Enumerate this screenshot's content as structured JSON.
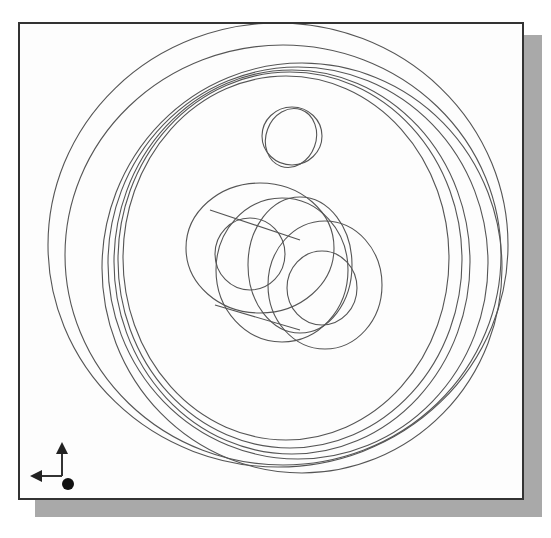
{
  "viewport": {
    "background": "#fdfdfd",
    "border_color": "#333333",
    "shadow_color": "#a9a9a9",
    "line_color": "#555555"
  },
  "model": {
    "description": "Isometric wireframe of a circular wheel/disc with a small hole and an offset cylindrical boss",
    "outer_rings": [
      {
        "cx": 278,
        "cy": 245,
        "rx": 230,
        "ry": 222
      },
      {
        "cx": 283,
        "cy": 255,
        "rx": 218,
        "ry": 210
      },
      {
        "cx": 302,
        "cy": 268,
        "rx": 200,
        "ry": 205
      },
      {
        "cx": 298,
        "cy": 263,
        "rx": 190,
        "ry": 196
      },
      {
        "cx": 290,
        "cy": 260,
        "rx": 172,
        "ry": 188
      },
      {
        "cx": 286,
        "cy": 258,
        "rx": 163,
        "ry": 182
      },
      {
        "cx": 292,
        "cy": 262,
        "rx": 178,
        "ry": 192
      }
    ],
    "small_hole": [
      {
        "cx": 292,
        "cy": 136,
        "rx": 30,
        "ry": 29
      },
      {
        "cx": 291,
        "cy": 138,
        "rx": 25,
        "ry": 30,
        "rotate": 20
      }
    ],
    "boss": [
      {
        "cx": 260,
        "cy": 248,
        "rx": 74,
        "ry": 65
      },
      {
        "cx": 250,
        "cy": 254,
        "rx": 35,
        "ry": 36
      },
      {
        "cx": 282,
        "cy": 270,
        "rx": 66,
        "ry": 72
      },
      {
        "cx": 300,
        "cy": 265,
        "rx": 52,
        "ry": 68
      },
      {
        "cx": 325,
        "cy": 285,
        "rx": 57,
        "ry": 64
      },
      {
        "cx": 322,
        "cy": 288,
        "rx": 35,
        "ry": 37
      }
    ]
  },
  "triad": {
    "axes": [
      "up-arrow",
      "left-arrow",
      "origin-dot"
    ]
  }
}
